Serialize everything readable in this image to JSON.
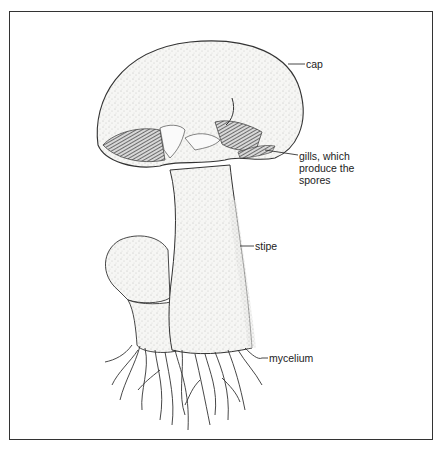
{
  "figure": {
    "labels": {
      "cap": "cap",
      "gills": "gills, which\nproduce the\nspores",
      "stipe": "stipe",
      "mycelium": "mycelium"
    },
    "colors": {
      "ink": "#222222",
      "stipple": "#8a8a8a",
      "fill": "#f4f4f2",
      "border": "#333333",
      "background": "#ffffff"
    }
  }
}
